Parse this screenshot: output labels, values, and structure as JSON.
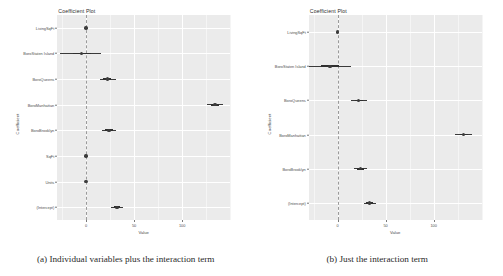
{
  "figure": {
    "panels": [
      {
        "id": "panel-a",
        "caption": "(a) Individual variables plus the interaction term",
        "title": "Coefficient Plot",
        "xlabel": "Value",
        "ylabel": "Coefficient"
      },
      {
        "id": "panel-b",
        "caption": "(b) Just the interaction term",
        "title": "Coefficient Plot",
        "xlabel": "Value",
        "ylabel": "Coefficient"
      }
    ]
  },
  "chart_data": [
    {
      "type": "scatter",
      "subplot": "a",
      "title": "Coefficient Plot",
      "xlabel": "Value",
      "ylabel": "Coefficient",
      "xlim": [
        -30,
        150
      ],
      "xticks": [
        0,
        50,
        100
      ],
      "xtick_labels": [
        "0",
        "50",
        "100"
      ],
      "grid": true,
      "legend": "none",
      "reference_line": 0,
      "reference_line_style": "dashed",
      "categories": [
        "LivingSqFt",
        "BoroStaten Island",
        "BoroQueens",
        "BoroManhattan",
        "BoroBrooklyn",
        "SqFt",
        "Units",
        "(Intercept)"
      ],
      "values": [
        0,
        -5,
        22,
        134,
        24,
        0,
        0,
        32
      ],
      "ci_low": [
        -1,
        -27,
        14,
        126,
        17,
        -1,
        -1,
        26
      ],
      "ci_high": [
        1,
        16,
        31,
        142,
        31,
        1,
        1,
        38
      ],
      "ci_inner_low": [
        -0.5,
        -14,
        18,
        130,
        20,
        -0.5,
        -0.5,
        29
      ],
      "ci_inner_high": [
        0.5,
        5,
        26,
        138,
        28,
        0.5,
        0.5,
        35
      ]
    },
    {
      "type": "scatter",
      "subplot": "b",
      "title": "Coefficient Plot",
      "xlabel": "Value",
      "ylabel": "Coefficient",
      "xlim": [
        -30,
        150
      ],
      "xticks": [
        0,
        50,
        100
      ],
      "xtick_labels": [
        "0",
        "50",
        "100"
      ],
      "grid": true,
      "legend": "none",
      "reference_line": 0,
      "reference_line_style": "dashed",
      "categories": [
        "LivingSqFt",
        "BoroStaten Island",
        "BoroQueens",
        "BoroManhattan",
        "BoroBrooklyn",
        "(Intercept)"
      ],
      "values": [
        0,
        -8,
        22,
        131,
        24,
        33
      ],
      "ci_low": [
        -1,
        -30,
        14,
        122,
        17,
        27
      ],
      "ci_high": [
        1,
        14,
        31,
        140,
        31,
        40
      ],
      "ci_inner_low": [
        -0.5,
        -17,
        18,
        127,
        20,
        30
      ],
      "ci_inner_high": [
        0.5,
        1,
        26,
        136,
        28,
        37
      ]
    }
  ]
}
